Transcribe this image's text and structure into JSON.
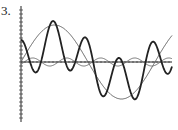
{
  "problem_label": "3.",
  "chart_data": {
    "type": "line",
    "title": "",
    "xlabel": "",
    "ylabel": "",
    "grid": false,
    "legend": null,
    "axes": {
      "origin_px": [
        21,
        62
      ],
      "x_end_px": 172,
      "y_top_px": 6,
      "y_bottom_px": 122,
      "tick_spacing_px": 4
    },
    "x_range": [
      0,
      14.2
    ],
    "ylim": [
      -1.6,
      1.6
    ],
    "series": [
      {
        "name": "large slow wave",
        "style": "thin",
        "amplitude": 1.0,
        "formula": "sin(x/2)"
      },
      {
        "name": "bold fast wave",
        "style": "bold",
        "formula": "sin(x/2) * cos(2x) scaled-like; peaks at x≈3.1, 7.7, 10.5, troughs at x≈1.6, 4.6, 9.3, 14.0"
      },
      {
        "name": "small ripple",
        "style": "thin",
        "amplitude": 0.12,
        "formula": "small sin with period ≈ 3.2"
      }
    ]
  }
}
